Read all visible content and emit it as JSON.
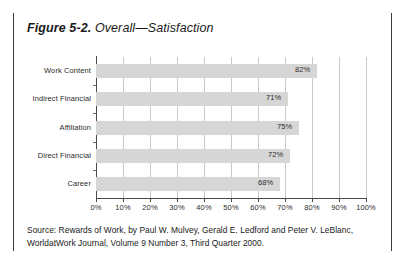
{
  "figure": {
    "number_label": "Figure 5-2.",
    "title": "Overall—Satisfaction"
  },
  "source": {
    "line1": "Source: Rewards of Work, by Paul W. Mulvey, Gerald E. Ledford and Peter V. LeBlanc,",
    "line2": "WorldatWork Journal, Volume 9 Number 3, Third Quarter 2000."
  },
  "colors": {
    "bar_fill": "#d6d6d6",
    "gridline": "#c9c9c9",
    "axis": "#4a4a4a",
    "text": "#1a1a1a",
    "page_rule": "#3a3a3a",
    "background": "#ffffff"
  },
  "chart_data": {
    "type": "bar",
    "orientation": "horizontal",
    "title": "Overall—Satisfaction",
    "xlabel": "",
    "ylabel": "",
    "categories": [
      "Work Content",
      "Indirect Financial",
      "Affiliation",
      "Direct Financial",
      "Career"
    ],
    "values": [
      82,
      71,
      75,
      72,
      68
    ],
    "data_labels": [
      "82%",
      "71%",
      "75%",
      "72%",
      "68%"
    ],
    "xlim": [
      0,
      100
    ],
    "xticks": [
      0,
      10,
      20,
      30,
      40,
      50,
      60,
      70,
      80,
      90,
      100
    ],
    "xtick_labels": [
      "0%",
      "10%",
      "20%",
      "30%",
      "40%",
      "50%",
      "60%",
      "70%",
      "80%",
      "90%",
      "100%"
    ],
    "grid": "vertical",
    "legend": "none",
    "units": "percent"
  }
}
